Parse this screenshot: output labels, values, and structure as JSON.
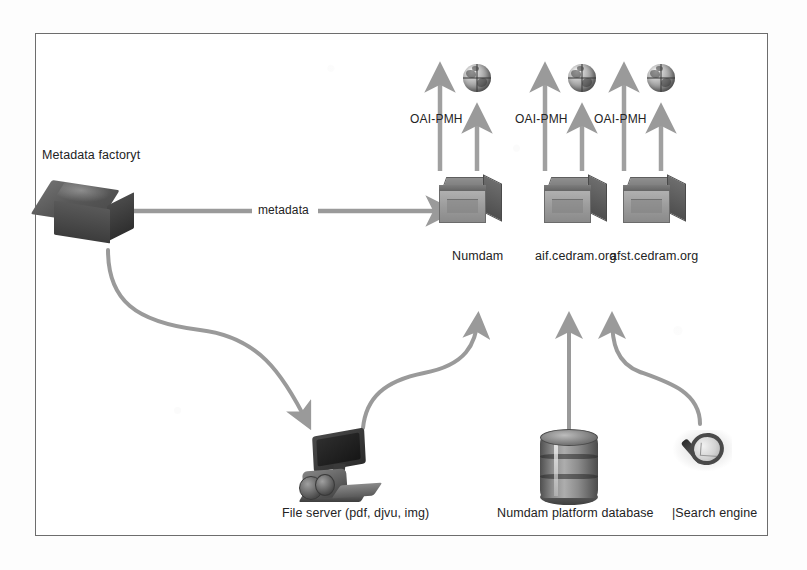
{
  "diagram": {
    "colors": {
      "frame_border": "#6d6d6d",
      "arrow": "#9a9a9a",
      "arrow_dark": "#8a8a8a",
      "text": "#232323",
      "background": "#ffffff"
    },
    "source": {
      "label": "Metadata factoryt",
      "icon": "grey-box-icon"
    },
    "flow_label": "metadata",
    "repositories": [
      {
        "label": "Numdam",
        "protocol": "OAI-PMH",
        "icon": "repository-box-icon",
        "output_icon": "globe-icon"
      },
      {
        "label": "aif.cedram.org",
        "protocol": "OAI-PMH",
        "icon": "repository-box-icon",
        "output_icon": "globe-icon"
      },
      {
        "label": "afst.cedram.org",
        "protocol": "OAI-PMH",
        "icon": "repository-box-icon",
        "output_icon": "globe-icon"
      }
    ],
    "sources": [
      {
        "label": "File server (pdf, djvu, img)",
        "icon": "file-server-icon"
      },
      {
        "label": "Numdam platform database",
        "icon": "database-barrel-icon"
      },
      {
        "label": "|Search engine",
        "icon": "magnifier-icon"
      }
    ]
  }
}
